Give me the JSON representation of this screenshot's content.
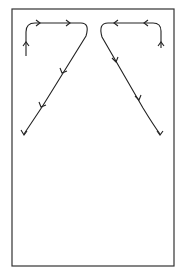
{
  "diagram": {
    "type": "path-trajectories",
    "frame": {
      "x": 12,
      "y": 9,
      "width": 162,
      "height": 257,
      "stroke": "#333333"
    },
    "paths": [
      {
        "name": "left-path",
        "d": "M26,56 L26,32 Q26,23 35,23 L81,23 Q90,23 86,36 L42,107 Q30,125 24,134",
        "arrows_count": 5
      },
      {
        "name": "right-path",
        "d": "M161,48 L161,31 Q161,23 153,23 L108,23 Q98,23 102,37 L143,108 Q154,126 160,134",
        "arrows_count": 5
      }
    ],
    "caption": ""
  }
}
